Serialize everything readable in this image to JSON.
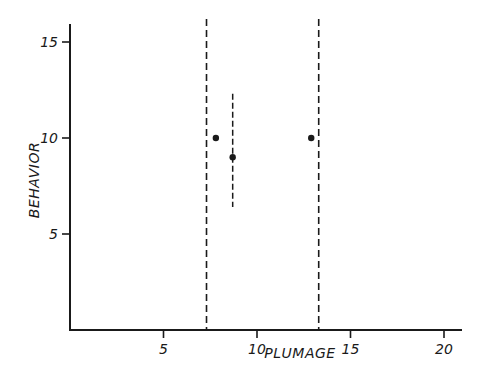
{
  "chart_data": {
    "type": "scatter",
    "title": "",
    "xlabel": "PLUMAGE",
    "ylabel": "BEHAVIOR",
    "xlim": [
      0,
      21
    ],
    "ylim": [
      0,
      15.5
    ],
    "x_ticks": [
      5,
      10,
      15,
      20
    ],
    "y_ticks": [
      5,
      10,
      15
    ],
    "x_tick_labels": [
      "5",
      "10",
      "15",
      "20"
    ],
    "y_tick_labels": [
      "5",
      "10",
      "15"
    ],
    "grid": false,
    "legend": null,
    "series": [
      {
        "name": "points",
        "points": [
          {
            "x": 7.8,
            "y": 10
          },
          {
            "x": 8.7,
            "y": 9
          },
          {
            "x": 12.9,
            "y": 10
          }
        ]
      }
    ],
    "error_bars": [
      {
        "x": 8.7,
        "y_low": 6.4,
        "y_high": 12.3,
        "style": "dashed"
      }
    ],
    "reference_lines": [
      {
        "orientation": "vertical",
        "x": 7.3,
        "style": "dashed"
      },
      {
        "orientation": "vertical",
        "x": 13.3,
        "style": "dashed"
      }
    ],
    "colors": {
      "ink": "#1a1a1a",
      "background": "#ffffff"
    }
  }
}
